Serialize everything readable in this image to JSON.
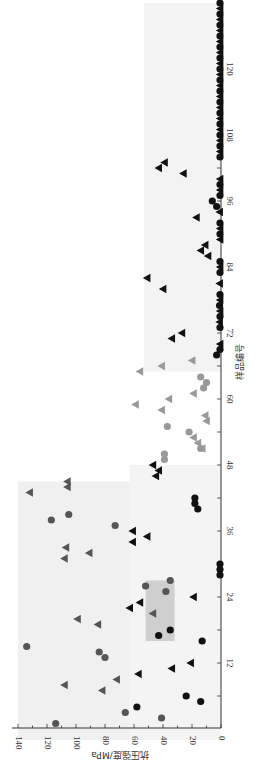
{
  "chart_data": {
    "type": "scatter",
    "orientation": "rotated-90-clockwise",
    "title": "",
    "xlabel": "样品编号",
    "ylabel": "抗压强度/MPa",
    "xlim": [
      0,
      132
    ],
    "ylim": [
      0,
      140
    ],
    "x_ticks": [
      12,
      24,
      36,
      48,
      60,
      72,
      84,
      96,
      108,
      120
    ],
    "y_ticks": [
      0,
      20,
      40,
      60,
      80,
      100,
      120,
      140
    ],
    "grid": false,
    "legend": null,
    "series": [
      {
        "name": "dark-gray-circles",
        "marker": "circle",
        "color": "#555555",
        "points": [
          [
            1,
            114
          ],
          [
            13,
            80
          ],
          [
            14,
            84
          ],
          [
            15,
            134
          ],
          [
            25,
            38
          ],
          [
            26,
            52
          ],
          [
            27,
            35
          ],
          [
            37,
            73
          ],
          [
            38,
            117
          ],
          [
            39,
            105
          ],
          [
            2,
            41
          ],
          [
            3,
            66
          ]
        ]
      },
      {
        "name": "black-circles",
        "marker": "circle",
        "color": "#111111",
        "points": [
          [
            4,
            58
          ],
          [
            5,
            14
          ],
          [
            6,
            24
          ],
          [
            16,
            13
          ],
          [
            17,
            43
          ],
          [
            18,
            35
          ],
          [
            28,
            0
          ],
          [
            29,
            0
          ],
          [
            30,
            0
          ],
          [
            40,
            16
          ],
          [
            41,
            18
          ],
          [
            42,
            18
          ],
          [
            68,
            3
          ],
          [
            95,
            3
          ],
          [
            96,
            6
          ]
        ]
      },
      {
        "name": "dark-gray-triangles",
        "marker": "triangle",
        "color": "#555555",
        "points": [
          [
            7,
            82
          ],
          [
            8,
            108
          ],
          [
            9,
            72
          ],
          [
            19,
            85
          ],
          [
            20,
            99
          ],
          [
            21,
            47
          ],
          [
            31,
            108
          ],
          [
            32,
            91
          ],
          [
            33,
            107
          ],
          [
            43,
            132
          ],
          [
            44,
            106
          ],
          [
            45,
            106
          ]
        ]
      },
      {
        "name": "black-triangles",
        "marker": "triangle",
        "color": "#111111",
        "points": [
          [
            10,
            57
          ],
          [
            11,
            34
          ],
          [
            12,
            21
          ],
          [
            22,
            63
          ],
          [
            23,
            56
          ],
          [
            24,
            19
          ],
          [
            34,
            61
          ],
          [
            35,
            51
          ],
          [
            36,
            61
          ],
          [
            46,
            45
          ],
          [
            47,
            43
          ],
          [
            48,
            47
          ],
          [
            71,
            34
          ],
          [
            72,
            27
          ],
          [
            80,
            40
          ],
          [
            82,
            51
          ],
          [
            86,
            9
          ],
          [
            87,
            14
          ],
          [
            88,
            11
          ],
          [
            93,
            17
          ],
          [
            101,
            26
          ],
          [
            102,
            43
          ],
          [
            103,
            39
          ]
        ]
      },
      {
        "name": "light-gray-circles",
        "marker": "circle",
        "color": "#999999",
        "points": [
          [
            49,
            39
          ],
          [
            50,
            39
          ],
          [
            51,
            14
          ],
          [
            54,
            22
          ],
          [
            55,
            37
          ],
          [
            62,
            12
          ],
          [
            63,
            10
          ],
          [
            64,
            14
          ]
        ]
      },
      {
        "name": "light-gray-triangles",
        "marker": "triangle",
        "color": "#999999",
        "points": [
          [
            51,
            13
          ],
          [
            52,
            16
          ],
          [
            53,
            19
          ],
          [
            56,
            10
          ],
          [
            57,
            11
          ],
          [
            58,
            41
          ],
          [
            59,
            59
          ],
          [
            60,
            36
          ],
          [
            61,
            19
          ],
          [
            65,
            56
          ],
          [
            66,
            41
          ],
          [
            67,
            20
          ]
        ]
      },
      {
        "name": "baseline-black-markers",
        "marker": "mixed",
        "color": "#111111",
        "points": [
          [
            69,
            0
          ],
          [
            70,
            0
          ],
          [
            73,
            0
          ],
          [
            74,
            1
          ],
          [
            75,
            0
          ],
          [
            76,
            0
          ],
          [
            77,
            1
          ],
          [
            78,
            0
          ],
          [
            79,
            0
          ],
          [
            81,
            1
          ],
          [
            83,
            0
          ],
          [
            84,
            0
          ],
          [
            85,
            0
          ],
          [
            89,
            0
          ],
          [
            90,
            0
          ],
          [
            91,
            0
          ],
          [
            92,
            0
          ],
          [
            94,
            1
          ],
          [
            97,
            0
          ],
          [
            98,
            0
          ],
          [
            99,
            0
          ],
          [
            100,
            0
          ],
          [
            104,
            0
          ],
          [
            105,
            0
          ],
          [
            106,
            0
          ],
          [
            107,
            0
          ],
          [
            108,
            0
          ],
          [
            109,
            0
          ],
          [
            110,
            0
          ],
          [
            111,
            0
          ],
          [
            112,
            0
          ],
          [
            113,
            0
          ],
          [
            114,
            0
          ],
          [
            115,
            0
          ],
          [
            116,
            0
          ],
          [
            117,
            0
          ],
          [
            118,
            0
          ],
          [
            119,
            0
          ],
          [
            120,
            0
          ],
          [
            121,
            0
          ],
          [
            122,
            0
          ],
          [
            123,
            0
          ],
          [
            124,
            0
          ],
          [
            125,
            0
          ],
          [
            126,
            0
          ],
          [
            127,
            0
          ],
          [
            128,
            0
          ],
          [
            129,
            0
          ],
          [
            130,
            0
          ],
          [
            131,
            0
          ],
          [
            132,
            0
          ]
        ]
      }
    ],
    "background_regions": [
      {
        "name": "group-1-left",
        "x_range": [
          1,
          45
        ],
        "y_range": [
          63,
          140
        ],
        "color": "#f0f0f0"
      },
      {
        "name": "group-1-right",
        "x_range": [
          1,
          48
        ],
        "y_range": [
          0,
          63
        ],
        "color": "#f4f4f4"
      },
      {
        "name": "highlight-box",
        "x_range": [
          19,
          27
        ],
        "y_range": [
          32,
          52
        ],
        "color": "#cfcfcf"
      },
      {
        "name": "group-3",
        "x_range": [
          68,
          132
        ],
        "y_range": [
          0,
          53
        ],
        "color": "#f3f3f3"
      }
    ]
  }
}
